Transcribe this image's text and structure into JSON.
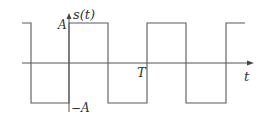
{
  "diagram": {
    "type": "square-wave",
    "colors": {
      "line": "#5a5a5a",
      "axis": "#555555",
      "text": "#333333"
    },
    "labels": {
      "y_axis": "s(t)",
      "x_axis": "t",
      "amplitude_pos": "A",
      "amplitude_neg": "−A",
      "period": "T"
    },
    "geometry": {
      "x_axis_y": 63,
      "y_axis_x": 69,
      "high_y": 23,
      "low_y": 103,
      "x_axis_start": 22,
      "x_axis_end": 254,
      "y_axis_top": 14,
      "y_axis_bottom": 112
    },
    "waveform_points": [
      [
        22,
        23
      ],
      [
        31,
        23
      ],
      [
        31,
        103
      ],
      [
        69,
        103
      ],
      [
        69,
        23
      ],
      [
        108,
        23
      ],
      [
        108,
        103
      ],
      [
        147,
        103
      ],
      [
        147,
        23
      ],
      [
        186,
        23
      ],
      [
        186,
        103
      ],
      [
        226,
        103
      ],
      [
        226,
        23
      ],
      [
        245,
        23
      ]
    ]
  }
}
